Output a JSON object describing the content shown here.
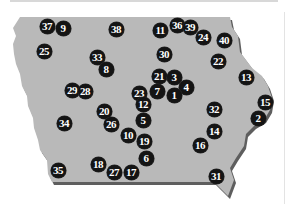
{
  "map": {
    "region": "Iowa",
    "colors": {
      "land": "#b9b9b9",
      "shadow": "#5e5e5e",
      "marker_fill": "#141414",
      "marker_text": "#ffffff"
    },
    "markers": [
      {
        "label": "37",
        "x": 47,
        "y": 26
      },
      {
        "label": "9",
        "x": 63,
        "y": 28
      },
      {
        "label": "38",
        "x": 116,
        "y": 29
      },
      {
        "label": "11",
        "x": 160,
        "y": 30
      },
      {
        "label": "36",
        "x": 177,
        "y": 25
      },
      {
        "label": "39",
        "x": 190,
        "y": 27
      },
      {
        "label": "24",
        "x": 203,
        "y": 37
      },
      {
        "label": "40",
        "x": 224,
        "y": 40
      },
      {
        "label": "25",
        "x": 44,
        "y": 51
      },
      {
        "label": "30",
        "x": 164,
        "y": 54
      },
      {
        "label": "22",
        "x": 218,
        "y": 61
      },
      {
        "label": "33",
        "x": 97,
        "y": 57
      },
      {
        "label": "8",
        "x": 106,
        "y": 69
      },
      {
        "label": "13",
        "x": 246,
        "y": 77
      },
      {
        "label": "21",
        "x": 159,
        "y": 76
      },
      {
        "label": "3",
        "x": 174,
        "y": 77
      },
      {
        "label": "4",
        "x": 186,
        "y": 87
      },
      {
        "label": "1",
        "x": 174,
        "y": 95
      },
      {
        "label": "7",
        "x": 157,
        "y": 91
      },
      {
        "label": "23",
        "x": 139,
        "y": 93
      },
      {
        "label": "29",
        "x": 72,
        "y": 90
      },
      {
        "label": "28",
        "x": 85,
        "y": 91
      },
      {
        "label": "12",
        "x": 143,
        "y": 104
      },
      {
        "label": "5",
        "x": 143,
        "y": 120
      },
      {
        "label": "20",
        "x": 104,
        "y": 111
      },
      {
        "label": "26",
        "x": 111,
        "y": 124
      },
      {
        "label": "34",
        "x": 64,
        "y": 123
      },
      {
        "label": "15",
        "x": 265,
        "y": 102
      },
      {
        "label": "2",
        "x": 258,
        "y": 118
      },
      {
        "label": "32",
        "x": 214,
        "y": 109
      },
      {
        "label": "14",
        "x": 214,
        "y": 131
      },
      {
        "label": "16",
        "x": 200,
        "y": 145
      },
      {
        "label": "10",
        "x": 128,
        "y": 135
      },
      {
        "label": "19",
        "x": 144,
        "y": 141
      },
      {
        "label": "6",
        "x": 146,
        "y": 158
      },
      {
        "label": "18",
        "x": 98,
        "y": 164
      },
      {
        "label": "27",
        "x": 114,
        "y": 172
      },
      {
        "label": "17",
        "x": 131,
        "y": 172
      },
      {
        "label": "35",
        "x": 58,
        "y": 170
      },
      {
        "label": "31",
        "x": 216,
        "y": 176
      }
    ]
  }
}
